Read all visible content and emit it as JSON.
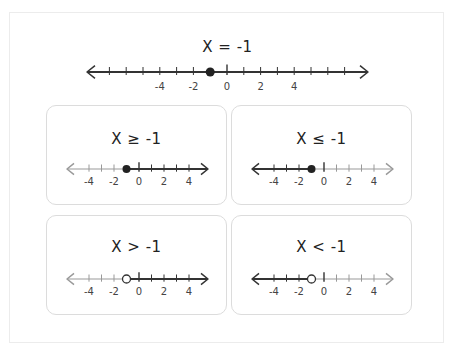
{
  "main": {
    "title": "X = -1",
    "point": -1,
    "point_style": "closed",
    "ticks_min": -7,
    "ticks_max": 7,
    "labels": [
      "-4",
      "-2",
      "0",
      "2",
      "4"
    ]
  },
  "cards": [
    {
      "title": "X ≥ -1",
      "point": -1,
      "point_style": "closed",
      "shade": "right"
    },
    {
      "title": "X ≤ -1",
      "point": -1,
      "point_style": "closed",
      "shade": "left"
    },
    {
      "title": "X > -1",
      "point": -1,
      "point_style": "open",
      "shade": "right"
    },
    {
      "title": "X < -1",
      "point": -1,
      "point_style": "open",
      "shade": "left"
    }
  ],
  "card_axis": {
    "ticks_min": -4,
    "ticks_max": 4,
    "labels": [
      "-4",
      "-2",
      "0",
      "2",
      "4"
    ]
  },
  "colors": {
    "line_dark": "#333333",
    "line_light": "#999999",
    "card_border": "#dcdcdc",
    "frame_border": "#ececec"
  }
}
